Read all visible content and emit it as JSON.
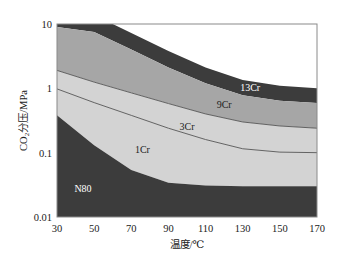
{
  "chart_data": {
    "type": "area",
    "title": "",
    "xlabel": "温度/℃",
    "ylabel": "CO2分压/MPa",
    "ylabel_parts": {
      "prefix": "CO",
      "sub": "2",
      "suffix": "分压/MPa"
    },
    "xlim": [
      30,
      170
    ],
    "ylim": [
      0.01,
      10
    ],
    "yscale": "log",
    "grid": false,
    "legend": "none (inline region labels)",
    "x_ticks": [
      "30",
      "50",
      "70",
      "90",
      "110",
      "130",
      "150",
      "170"
    ],
    "y_ticks": [
      "10",
      "1",
      "0.1",
      "0.01"
    ],
    "boundaries": [
      {
        "name": "13Cr upper limit",
        "x": [
          30,
          60,
          90,
          110,
          130,
          150,
          170
        ],
        "y": [
          10,
          10,
          3.8,
          2.1,
          1.35,
          1.1,
          1.0
        ]
      },
      {
        "name": "9Cr/13Cr",
        "x": [
          30,
          50,
          70,
          90,
          110,
          130,
          150,
          170
        ],
        "y": [
          9.0,
          7.5,
          4.0,
          2.1,
          1.2,
          0.78,
          0.64,
          0.59
        ]
      },
      {
        "name": "3Cr/9Cr",
        "x": [
          30,
          50,
          70,
          90,
          110,
          130,
          150,
          170
        ],
        "y": [
          1.9,
          1.25,
          0.85,
          0.58,
          0.4,
          0.3,
          0.26,
          0.24
        ]
      },
      {
        "name": "1Cr/3Cr",
        "x": [
          30,
          50,
          70,
          90,
          110,
          130,
          150,
          170
        ],
        "y": [
          0.98,
          0.6,
          0.38,
          0.24,
          0.16,
          0.115,
          0.102,
          0.1
        ]
      },
      {
        "name": "N80/1Cr",
        "x": [
          30,
          50,
          70,
          90,
          110,
          130,
          150,
          170
        ],
        "y": [
          0.38,
          0.13,
          0.054,
          0.034,
          0.031,
          0.03,
          0.03,
          0.03
        ]
      }
    ],
    "regions": [
      {
        "name": "13Cr",
        "color": "#3c3c3c",
        "label_x": 134,
        "label_y": 1.0,
        "label_color": "#ffffff"
      },
      {
        "name": "9Cr",
        "color": "#a6a6a6",
        "label_x": 120,
        "label_y": 0.55,
        "label_color": "#222222"
      },
      {
        "name": "3Cr",
        "color": "#d2d2d2",
        "label_x": 100,
        "label_y": 0.25,
        "label_color": "#222222"
      },
      {
        "name": "1Cr",
        "color": "#cfcfcf",
        "label_x": 76,
        "label_y": 0.11,
        "label_color": "#222222"
      },
      {
        "name": "N80",
        "color": "#3e3e3e",
        "label_x": 44,
        "label_y": 0.027,
        "label_color": "#ffffff"
      }
    ],
    "annotations": [
      "13Cr",
      "9Cr",
      "3Cr",
      "1Cr",
      "N80"
    ]
  },
  "colors": {
    "dark": "#3c3c3c",
    "mid": "#a6a6a6",
    "light": "#d3d3d3",
    "line": "#555555",
    "frame": "#8a8a8a"
  }
}
